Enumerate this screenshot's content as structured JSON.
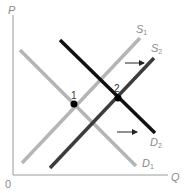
{
  "axes": {
    "y_label": "P",
    "x_label": "Q",
    "origin_label": "0",
    "color": "#9a9a9a"
  },
  "curves": [
    {
      "id": "D1",
      "label": "D",
      "sub": "1",
      "color": "#b5b5b5",
      "x1": 20,
      "y1": 50,
      "x2": 136,
      "y2": 166,
      "lx": 142,
      "ly": 167
    },
    {
      "id": "S1",
      "label": "S",
      "sub": "1",
      "color": "#b5b5b5",
      "x1": 22,
      "y1": 163,
      "x2": 140,
      "y2": 38,
      "lx": 136,
      "ly": 33
    },
    {
      "id": "S2",
      "label": "S",
      "sub": "2",
      "color": "#3c3c3c",
      "x1": 50,
      "y1": 168,
      "x2": 154,
      "y2": 58,
      "lx": 151,
      "ly": 52
    },
    {
      "id": "D2",
      "label": "D",
      "sub": "2",
      "color": "#111111",
      "x1": 60,
      "y1": 40,
      "x2": 155,
      "y2": 133,
      "lx": 150,
      "ly": 146
    }
  ],
  "points": [
    {
      "label": "1",
      "x": 74,
      "y": 104,
      "lx": 71,
      "ly": 99
    },
    {
      "label": "2",
      "x": 118,
      "y": 98,
      "lx": 114,
      "ly": 92
    }
  ],
  "arrows": [
    {
      "x1": 125,
      "y1": 63,
      "x2": 144,
      "y2": 63
    },
    {
      "x1": 117,
      "y1": 132,
      "x2": 137,
      "y2": 132
    }
  ]
}
